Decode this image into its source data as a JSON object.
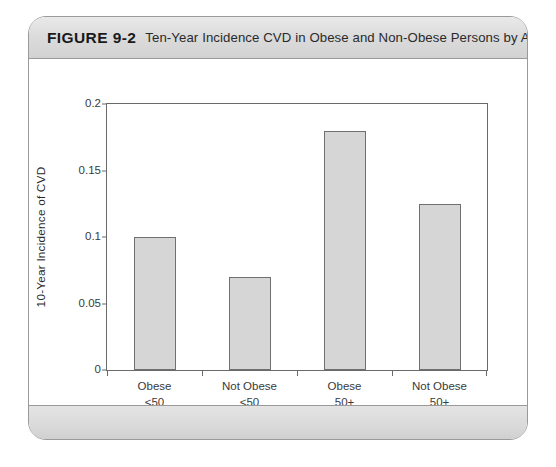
{
  "figure": {
    "label": "FIGURE 9-2",
    "caption": "Ten-Year Incidence CVD in Obese and Non-Obese Persons by Age Group"
  },
  "chart_data": {
    "type": "bar",
    "title": "Ten-Year Incidence CVD in Obese and Non-Obese Persons by Age Group",
    "categories": [
      "Obese\n<50",
      "Not Obese\n<50",
      "Obese\n50+",
      "Not Obese\n50+"
    ],
    "category_labels": [
      {
        "line1": "Obese",
        "line2": "<50"
      },
      {
        "line1": "Not Obese",
        "line2": "<50"
      },
      {
        "line1": "Obese",
        "line2": "50+"
      },
      {
        "line1": "Not Obese",
        "line2": "50+"
      }
    ],
    "values": [
      0.1,
      0.07,
      0.18,
      0.125
    ],
    "xlabel": "",
    "ylabel": "10-Year Incidence of CVD",
    "ylim": [
      0,
      0.2
    ],
    "yticks": [
      0,
      0.05,
      0.1,
      0.15,
      0.2
    ],
    "ytick_labels": [
      "0",
      "0.05",
      "0.1",
      "0.15",
      "0.2"
    ],
    "grid": false,
    "legend": null,
    "bar_fill_color": "#d6d6d6",
    "bar_border_color": "#707070",
    "axis_color": "#6a6a6a"
  }
}
